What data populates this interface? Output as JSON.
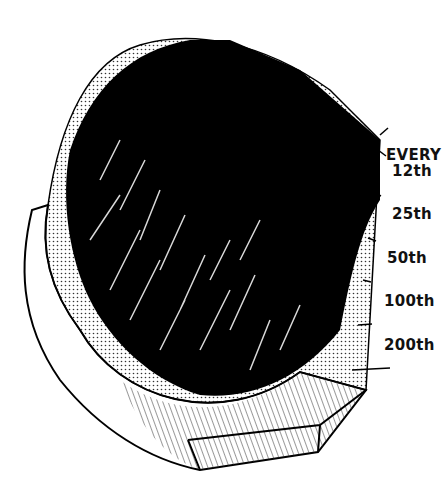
{
  "figure": {
    "ink_color": "#000000",
    "background_color": "#ffffff",
    "dot_fill_color": "#555555"
  },
  "scale_labels": [
    {
      "text": "EVERY",
      "x": 386,
      "y": 146
    },
    {
      "text": "12th",
      "x": 392,
      "y": 162
    },
    {
      "text": "25th",
      "x": 392,
      "y": 205
    },
    {
      "text": "50th",
      "x": 387,
      "y": 249
    },
    {
      "text": "100th",
      "x": 384,
      "y": 292
    },
    {
      "text": "200th",
      "x": 384,
      "y": 336
    }
  ]
}
